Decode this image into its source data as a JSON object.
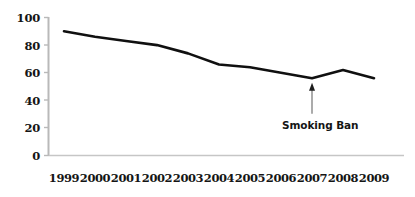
{
  "chart_data": {
    "type": "line",
    "title": "",
    "subtitle": "",
    "xlabel": "",
    "ylabel": "",
    "categories": [
      "1999",
      "2000",
      "2001",
      "2002",
      "2003",
      "2004",
      "2005",
      "2006",
      "2007",
      "2008",
      "2009"
    ],
    "values": [
      90,
      86,
      83,
      80,
      74,
      66,
      64,
      60,
      56,
      62,
      56
    ],
    "series": [
      {
        "name": "trend",
        "values": [
          90,
          86,
          83,
          80,
          74,
          66,
          64,
          60,
          56,
          62,
          56
        ],
        "color": "#101010"
      }
    ],
    "ylim": [
      0,
      100
    ],
    "yticks": [
      0,
      20,
      40,
      60,
      80,
      100
    ],
    "ytick_labels": [
      "0",
      "20",
      "40",
      "60",
      "80",
      "100"
    ],
    "xtick_labels": [
      "1999",
      "2000",
      "2001",
      "2002",
      "2003",
      "2004",
      "2005",
      "2006",
      "2007",
      "2008",
      "2009"
    ],
    "grid": false,
    "legend": false,
    "legend_position": "none",
    "annotations": [
      {
        "text": "Smoking Ban",
        "target_category": "2007",
        "target_value": 56,
        "marker": "up-arrow",
        "color": "#151515"
      }
    ],
    "axis_color": "#b9b9b9",
    "line_color": "#101010",
    "background_color": "#ffffff"
  },
  "axes": {
    "y_tick_labels": [
      "100",
      "80",
      "60",
      "40",
      "20",
      "0"
    ],
    "x_tick_labels": [
      "1999",
      "2000",
      "2001",
      "2002",
      "2003",
      "2004",
      "2005",
      "2006",
      "2007",
      "2008",
      "2009"
    ]
  },
  "annotation": {
    "label": "Smoking Ban"
  }
}
